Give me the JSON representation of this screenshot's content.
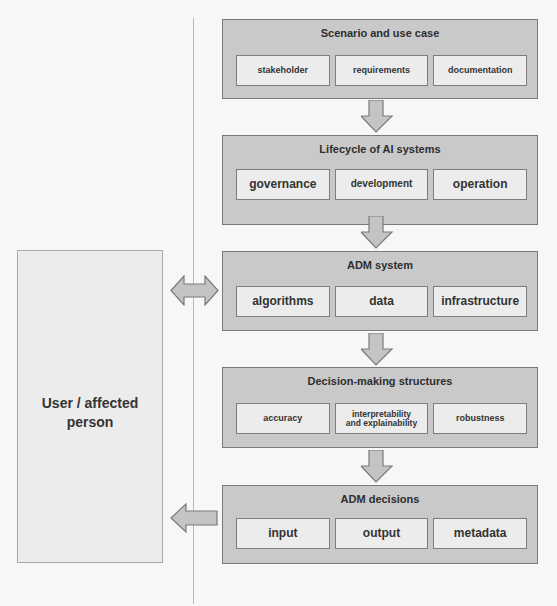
{
  "diagram": {
    "user": {
      "label_line1": "User / affected",
      "label_line2": "person"
    },
    "stages": [
      {
        "title": "Scenario and use case",
        "items": [
          "stakeholder",
          "requirements",
          "documentation"
        ]
      },
      {
        "title": "Lifecycle of AI systems",
        "items": [
          "governance",
          "development",
          "operation"
        ]
      },
      {
        "title": "ADM system",
        "items": [
          "algorithms",
          "data",
          "infrastructure"
        ]
      },
      {
        "title": "Decision-making structures",
        "items": [
          "accuracy",
          "interpretability and explainability",
          "robustness"
        ],
        "item_lines": {
          "interpretability_line1": "interpretability",
          "interpretability_line2": "and explainability"
        }
      },
      {
        "title": "ADM decisions",
        "items": [
          "input",
          "output",
          "metadata"
        ]
      }
    ],
    "connectors": {
      "flow": "top-to-bottom arrows between stages",
      "bidirectional": "User / affected person <-> ADM system",
      "unidirectional": "ADM decisions -> User / affected person"
    },
    "colors": {
      "stage_fill": "#c9c9c9",
      "item_fill": "#ececec",
      "border": "#7a7a7a",
      "arrow_fill": "#c4c4c4",
      "user_fill": "#ececec"
    }
  }
}
